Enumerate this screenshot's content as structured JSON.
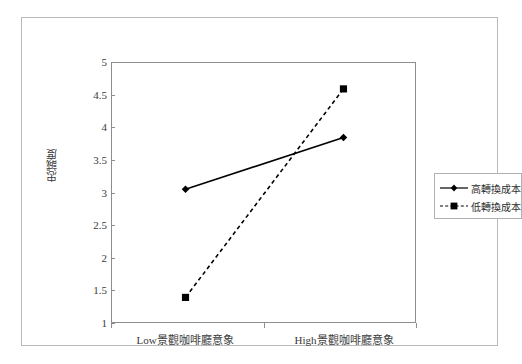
{
  "chart_data": {
    "type": "line",
    "title": "",
    "subtitle": "",
    "xlabel": "",
    "ylabel": "忠誠度",
    "categories": [
      "Low景觀咖啡廳意象",
      "High景觀咖啡廳意象"
    ],
    "category_parts": [
      {
        "latin": "Low",
        "cjk": "景觀咖啡廳意象"
      },
      {
        "latin": "High",
        "cjk": "景觀咖啡廳意象"
      }
    ],
    "series": [
      {
        "name": "高轉換成本",
        "values": [
          3.05,
          3.85
        ],
        "marker": "diamond",
        "linestyle": "solid",
        "color": "#000000"
      },
      {
        "name": "低轉換成本",
        "values": [
          1.38,
          4.6
        ],
        "marker": "square",
        "linestyle": "dashed",
        "color": "#000000"
      }
    ],
    "ylim": [
      1,
      5
    ],
    "yticks": [
      "1",
      "1.5",
      "2",
      "2.5",
      "3",
      "3.5",
      "4",
      "4.5",
      "5"
    ],
    "ytick_values": [
      1,
      1.5,
      2,
      2.5,
      3,
      3.5,
      4,
      4.5,
      5
    ],
    "grid": false,
    "legend_position": "right",
    "plot_border": true
  },
  "legend": {
    "entries": [
      {
        "label": "高轉換成本",
        "marker": "diamond",
        "linestyle": "solid"
      },
      {
        "label": "低轉換成本",
        "marker": "square",
        "linestyle": "dashed"
      }
    ]
  },
  "colors": {
    "frame": "#b9b9b9",
    "axis": "#8d8d8d",
    "series": "#000000",
    "text": "#3a3a3a",
    "background": "#ffffff"
  }
}
